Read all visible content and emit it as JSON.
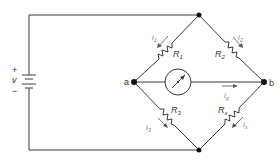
{
  "diagram": {
    "type": "wheatstone-bridge",
    "source": {
      "label": "v",
      "plus": "+",
      "minus": "−"
    },
    "nodes": {
      "a": "a",
      "b": "b"
    },
    "resistors": {
      "r1": {
        "label": "R",
        "sub": "1",
        "current": "i",
        "current_sub": "1"
      },
      "r2": {
        "label": "R",
        "sub": "2",
        "current": "i",
        "current_sub": "2"
      },
      "r3": {
        "label": "R",
        "sub": "3",
        "current": "i",
        "current_sub": "3"
      },
      "rx": {
        "label": "R",
        "sub": "x",
        "current": "i",
        "current_sub": "x"
      }
    },
    "galvanometer": {
      "current": "i",
      "current_sub": "g"
    },
    "colors": {
      "wire": "#3a3a3a",
      "node": "#111111",
      "current_label": "#888888"
    }
  }
}
